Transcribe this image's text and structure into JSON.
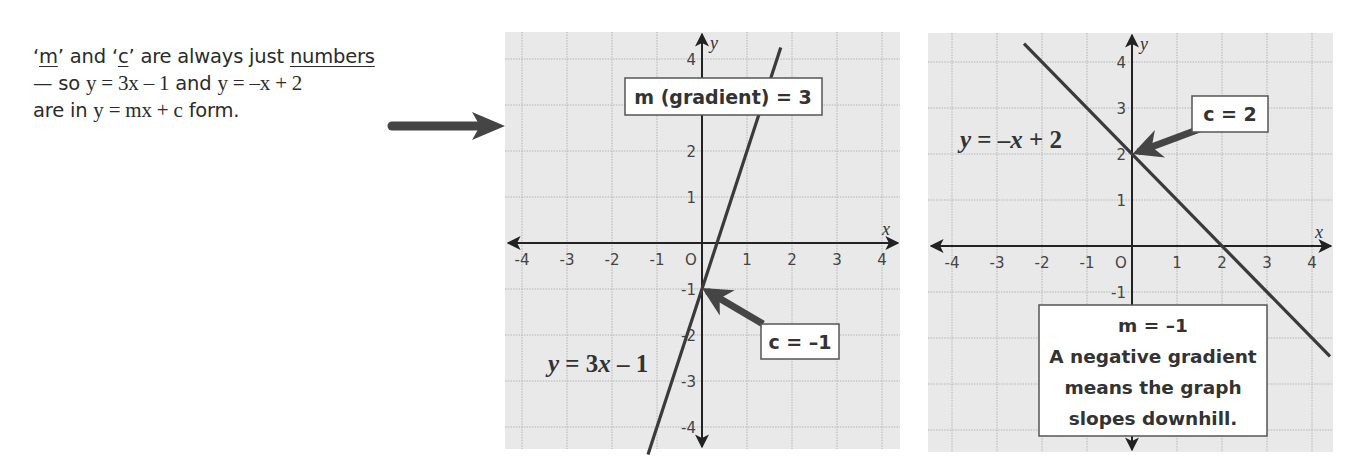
{
  "intro": {
    "line1": {
      "q1_open": "‘",
      "m": "m",
      "q1_close": "’ and ‘",
      "c": "c",
      "q2_close": "’ are always just ",
      "numbers": "numbers"
    },
    "line2": {
      "prefix": "— so ",
      "eq1": "y = 3x – 1",
      "and": " and ",
      "eq2": "y = –x + 2"
    },
    "line3": {
      "prefix": "are in ",
      "eq": "y = mx + c",
      "suffix": " form."
    }
  },
  "colors": {
    "grid_bg": "#e9e9e9",
    "grid_line": "#b5b5b5",
    "axis": "#222222",
    "graph_line": "#3a3a3a",
    "arrow": "#454545",
    "box_border": "#555555",
    "box_bg": "#ffffff"
  },
  "chart_data": [
    {
      "type": "line",
      "title": "",
      "xlabel": "x",
      "ylabel": "y",
      "xlim": [
        -4.4,
        4.4
      ],
      "ylim": [
        -4.5,
        4.5
      ],
      "x_ticks": [
        "-4",
        "-3",
        "-2",
        "-1",
        "O",
        "1",
        "2",
        "3",
        "4"
      ],
      "y_ticks": [
        "4",
        "3",
        "2",
        "1",
        "-1",
        "-2",
        "-3",
        "-4"
      ],
      "grid": true,
      "series": [
        {
          "name": "y = 3x – 1",
          "equation": "y = 3x – 1",
          "gradient": 3,
          "intercept": -1,
          "x": [
            -1.2,
            1.75
          ],
          "y": [
            -4.6,
            4.25
          ]
        }
      ],
      "annotations": [
        {
          "text": "m (gradient) = 3"
        },
        {
          "text": "c = –1",
          "points_to": [
            0,
            -1
          ]
        },
        {
          "text": "y = 3x – 1"
        }
      ]
    },
    {
      "type": "line",
      "title": "",
      "xlabel": "x",
      "ylabel": "y",
      "xlim": [
        -4.4,
        4.4
      ],
      "ylim": [
        -4.5,
        4.5
      ],
      "x_ticks": [
        "-4",
        "-3",
        "-2",
        "-1",
        "O",
        "1",
        "2",
        "3",
        "4"
      ],
      "y_ticks": [
        "4",
        "3",
        "2",
        "1",
        "-1",
        "-4"
      ],
      "grid": true,
      "series": [
        {
          "name": "y = –x + 2",
          "equation": "y = –x + 2",
          "gradient": -1,
          "intercept": 2,
          "x": [
            -2.4,
            4.4
          ],
          "y": [
            4.4,
            -2.4
          ]
        }
      ],
      "annotations": [
        {
          "text": "c = 2",
          "points_to": [
            0,
            2
          ]
        },
        {
          "text": "y = –x + 2"
        },
        {
          "text": "m = –1"
        },
        {
          "text": "A negative gradient"
        },
        {
          "text": "means the graph"
        },
        {
          "text": "slopes downhill."
        }
      ]
    }
  ],
  "graph1": {
    "m_box": "m (gradient) = 3",
    "c_box": "c = –1",
    "eq_label": {
      "y": "y",
      "rest": " = 3",
      "x": "x",
      "tail": " – 1"
    },
    "axis_x": "x",
    "axis_y": "y"
  },
  "graph2": {
    "c_box": "c = 2",
    "eq_label": {
      "y": "y",
      "rest": " = –",
      "x": "x",
      "tail": " + 2"
    },
    "m_box": {
      "line1": "m = –1",
      "line2": "A negative gradient",
      "line3": "means the graph",
      "line4": "slopes downhill."
    },
    "axis_x": "x",
    "axis_y": "y"
  }
}
